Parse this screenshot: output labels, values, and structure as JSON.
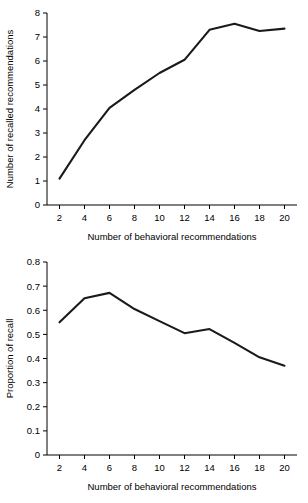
{
  "figure": {
    "background": "#ffffff",
    "line_color": "#1a1a1a",
    "axis_color": "#000000"
  },
  "chart_data": [
    {
      "id": "top",
      "type": "line",
      "title": "",
      "xlabel": "Number of behavioral recommendations",
      "ylabel": "Number of recalled recommendations",
      "xlim": [
        1,
        21
      ],
      "ylim": [
        0,
        8
      ],
      "grid": false,
      "legend": false,
      "xticks": [
        2,
        4,
        6,
        8,
        10,
        12,
        14,
        16,
        18,
        20
      ],
      "xtick_labels": [
        "2",
        "4",
        "6",
        "8",
        "10",
        "12",
        "14",
        "16",
        "18",
        "20"
      ],
      "yticks": [
        0,
        1,
        2,
        3,
        4,
        5,
        6,
        7,
        8
      ],
      "ytick_labels": [
        "0",
        "1",
        "2",
        "3",
        "4",
        "5",
        "6",
        "7",
        "8"
      ],
      "x": [
        2,
        4,
        6,
        8,
        10,
        12,
        14,
        16,
        18,
        20
      ],
      "values": [
        1.1,
        2.7,
        4.05,
        4.8,
        5.5,
        6.05,
        7.3,
        7.55,
        7.25,
        7.35
      ]
    },
    {
      "id": "bottom",
      "type": "line",
      "title": "",
      "xlabel": "Number of behavioral recommendations",
      "ylabel": "Proportion of recall",
      "xlim": [
        1,
        21
      ],
      "ylim": [
        0,
        0.8
      ],
      "grid": false,
      "legend": false,
      "xticks": [
        2,
        4,
        6,
        8,
        10,
        12,
        14,
        16,
        18,
        20
      ],
      "xtick_labels": [
        "2",
        "4",
        "6",
        "8",
        "10",
        "12",
        "14",
        "16",
        "18",
        "20"
      ],
      "yticks": [
        0,
        0.1,
        0.2,
        0.3,
        0.4,
        0.5,
        0.6,
        0.7,
        0.8
      ],
      "ytick_labels": [
        "0",
        "0.1",
        "0.2",
        "0.3",
        "0.4",
        "0.5",
        "0.6",
        "0.7",
        "0.8"
      ],
      "x": [
        2,
        4,
        6,
        8,
        10,
        12,
        14,
        16,
        18,
        20
      ],
      "values": [
        0.55,
        0.65,
        0.672,
        0.605,
        0.555,
        0.505,
        0.522,
        0.465,
        0.405,
        0.37
      ]
    }
  ]
}
